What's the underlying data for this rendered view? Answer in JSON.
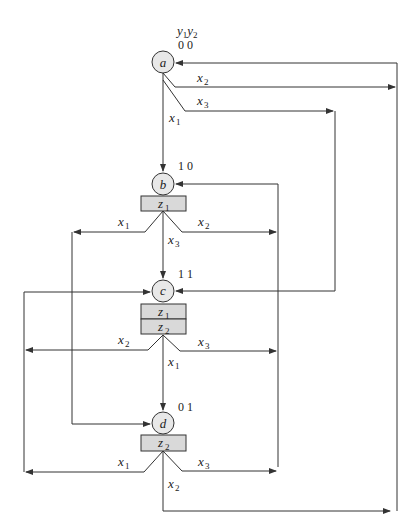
{
  "diagram": {
    "type": "state-machine-flow-graph",
    "header": {
      "var1": "y",
      "var1_sub": "1",
      "var2": "y",
      "var2_sub": "2"
    },
    "colors": {
      "line": "#333333",
      "state_fill": "#e8e8e8",
      "output_fill": "#d9d9d9",
      "background": "#ffffff"
    },
    "states": [
      {
        "id": "a",
        "code": "0 0",
        "outputs": []
      },
      {
        "id": "b",
        "code": "1 0",
        "outputs": [
          {
            "name": "z",
            "sub": "1"
          }
        ]
      },
      {
        "id": "c",
        "code": "1 1",
        "outputs": [
          {
            "name": "z",
            "sub": "1"
          },
          {
            "name": "z",
            "sub": "2"
          }
        ]
      },
      {
        "id": "d",
        "code": "0 1",
        "outputs": [
          {
            "name": "z",
            "sub": "2"
          }
        ]
      }
    ],
    "transitions": [
      {
        "from": "a",
        "to": "a",
        "label": "x",
        "sub": "2"
      },
      {
        "from": "a",
        "to": "c",
        "label": "x",
        "sub": "3"
      },
      {
        "from": "a",
        "to": "b",
        "label": "x",
        "sub": "1"
      },
      {
        "from": "b",
        "to": "d",
        "label": "x",
        "sub": "1"
      },
      {
        "from": "b",
        "to": "b",
        "label": "x",
        "sub": "2"
      },
      {
        "from": "b",
        "to": "c",
        "label": "x",
        "sub": "3"
      },
      {
        "from": "c",
        "to": "c",
        "label": "x",
        "sub": "2"
      },
      {
        "from": "c",
        "to": "b",
        "label": "x",
        "sub": "3"
      },
      {
        "from": "c",
        "to": "d",
        "label": "x",
        "sub": "1"
      },
      {
        "from": "d",
        "to": "c",
        "label": "x",
        "sub": "1"
      },
      {
        "from": "d",
        "to": "b",
        "label": "x",
        "sub": "3"
      },
      {
        "from": "d",
        "to": "a",
        "label": "x",
        "sub": "2"
      }
    ]
  }
}
